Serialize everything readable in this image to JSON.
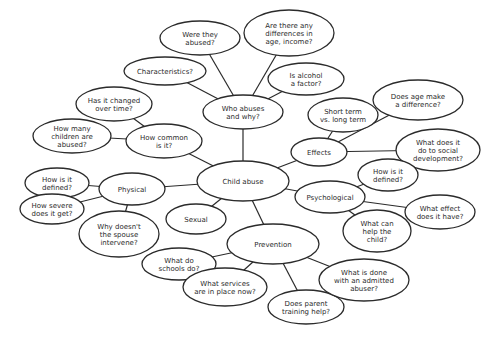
{
  "diagram": {
    "type": "mind-map",
    "title": "Child abuse",
    "colors": {
      "stroke": "#2b2b2b",
      "fill": "#ffffff",
      "text": "#2b2b2b",
      "background": "#ffffff"
    },
    "nodes": [
      {
        "id": "child-abuse",
        "lines": [
          "Child abuse"
        ],
        "cx": 243,
        "cy": 181,
        "rx": 46,
        "ry": 20
      },
      {
        "id": "who-abuses",
        "lines": [
          "Who abuses",
          "and why?"
        ],
        "cx": 243,
        "cy": 112,
        "rx": 40,
        "ry": 17
      },
      {
        "id": "were-they-abused",
        "lines": [
          "Were they",
          "abused?"
        ],
        "cx": 200,
        "cy": 38,
        "rx": 40,
        "ry": 17
      },
      {
        "id": "differences",
        "lines": [
          "Are there any",
          "differences in",
          "age, income?"
        ],
        "cx": 289,
        "cy": 33,
        "rx": 45,
        "ry": 23
      },
      {
        "id": "characteristics",
        "lines": [
          "Characteristics?"
        ],
        "cx": 165,
        "cy": 71,
        "rx": 41,
        "ry": 14
      },
      {
        "id": "alcohol",
        "lines": [
          "Is alcohol",
          "a factor?"
        ],
        "cx": 306,
        "cy": 79,
        "rx": 38,
        "ry": 16
      },
      {
        "id": "changed-over-time",
        "lines": [
          "Has it changed",
          "over time?"
        ],
        "cx": 114,
        "cy": 104,
        "rx": 38,
        "ry": 17
      },
      {
        "id": "how-many",
        "lines": [
          "How many",
          "children are",
          "abused?"
        ],
        "cx": 72,
        "cy": 136,
        "rx": 39,
        "ry": 17
      },
      {
        "id": "how-common",
        "lines": [
          "How common",
          "is it?"
        ],
        "cx": 164,
        "cy": 141,
        "rx": 38,
        "ry": 17
      },
      {
        "id": "short-long-term",
        "lines": [
          "Short term",
          "vs. long term"
        ],
        "cx": 343,
        "cy": 115,
        "rx": 35,
        "ry": 17
      },
      {
        "id": "age-difference",
        "lines": [
          "Does age make",
          "a difference?"
        ],
        "cx": 418,
        "cy": 100,
        "rx": 45,
        "ry": 20
      },
      {
        "id": "social-development",
        "lines": [
          "What does it",
          "do to social",
          "development?"
        ],
        "cx": 438,
        "cy": 150,
        "rx": 42,
        "ry": 21
      },
      {
        "id": "effects",
        "lines": [
          "Effects"
        ],
        "cx": 319,
        "cy": 152,
        "rx": 28,
        "ry": 14
      },
      {
        "id": "psych-defined",
        "lines": [
          "How is it",
          "defined?"
        ],
        "cx": 388,
        "cy": 175,
        "rx": 30,
        "ry": 16
      },
      {
        "id": "psychological",
        "lines": [
          "Psychological"
        ],
        "cx": 330,
        "cy": 197,
        "rx": 35,
        "ry": 16
      },
      {
        "id": "what-effect",
        "lines": [
          "What effect",
          "does it have?"
        ],
        "cx": 440,
        "cy": 212,
        "rx": 35,
        "ry": 17
      },
      {
        "id": "help-child",
        "lines": [
          "What can",
          "help the",
          "child?"
        ],
        "cx": 377,
        "cy": 231,
        "rx": 34,
        "ry": 21
      },
      {
        "id": "phys-defined",
        "lines": [
          "How is it",
          "defined?"
        ],
        "cx": 57,
        "cy": 183,
        "rx": 32,
        "ry": 15
      },
      {
        "id": "physical",
        "lines": [
          "Physical"
        ],
        "cx": 132,
        "cy": 189,
        "rx": 33,
        "ry": 16
      },
      {
        "id": "how-severe",
        "lines": [
          "How severe",
          "does it get?"
        ],
        "cx": 52,
        "cy": 209,
        "rx": 32,
        "ry": 15
      },
      {
        "id": "spouse-intervene",
        "lines": [
          "Why doesn't",
          "the spouse",
          "intervene?"
        ],
        "cx": 119,
        "cy": 234,
        "rx": 40,
        "ry": 23
      },
      {
        "id": "sexual",
        "lines": [
          "Sexual"
        ],
        "cx": 196,
        "cy": 219,
        "rx": 30,
        "ry": 15
      },
      {
        "id": "prevention",
        "lines": [
          "Prevention"
        ],
        "cx": 273,
        "cy": 244,
        "rx": 46,
        "ry": 20
      },
      {
        "id": "schools",
        "lines": [
          "What do",
          "schools do?"
        ],
        "cx": 179,
        "cy": 264,
        "rx": 37,
        "ry": 16
      },
      {
        "id": "services",
        "lines": [
          "What services",
          "are in place now?"
        ],
        "cx": 225,
        "cy": 287,
        "rx": 42,
        "ry": 19
      },
      {
        "id": "parent-training",
        "lines": [
          "Does parent",
          "training help?"
        ],
        "cx": 306,
        "cy": 307,
        "rx": 38,
        "ry": 17
      },
      {
        "id": "admitted-abuser",
        "lines": [
          "What is done",
          "with an admitted",
          "abuser?"
        ],
        "cx": 364,
        "cy": 280,
        "rx": 45,
        "ry": 21
      }
    ],
    "edges": [
      [
        "child-abuse",
        "who-abuses"
      ],
      [
        "child-abuse",
        "how-common"
      ],
      [
        "child-abuse",
        "effects"
      ],
      [
        "child-abuse",
        "psychological"
      ],
      [
        "child-abuse",
        "physical"
      ],
      [
        "child-abuse",
        "sexual"
      ],
      [
        "child-abuse",
        "prevention"
      ],
      [
        "who-abuses",
        "were-they-abused"
      ],
      [
        "who-abuses",
        "differences"
      ],
      [
        "who-abuses",
        "characteristics"
      ],
      [
        "who-abuses",
        "alcohol"
      ],
      [
        "how-common",
        "changed-over-time"
      ],
      [
        "how-common",
        "how-many"
      ],
      [
        "effects",
        "short-long-term"
      ],
      [
        "effects",
        "age-difference"
      ],
      [
        "effects",
        "social-development"
      ],
      [
        "psychological",
        "psych-defined"
      ],
      [
        "psychological",
        "what-effect"
      ],
      [
        "psychological",
        "help-child"
      ],
      [
        "physical",
        "phys-defined"
      ],
      [
        "physical",
        "how-severe"
      ],
      [
        "physical",
        "spouse-intervene"
      ],
      [
        "prevention",
        "schools"
      ],
      [
        "prevention",
        "services"
      ],
      [
        "prevention",
        "parent-training"
      ],
      [
        "prevention",
        "admitted-abuser"
      ]
    ]
  }
}
